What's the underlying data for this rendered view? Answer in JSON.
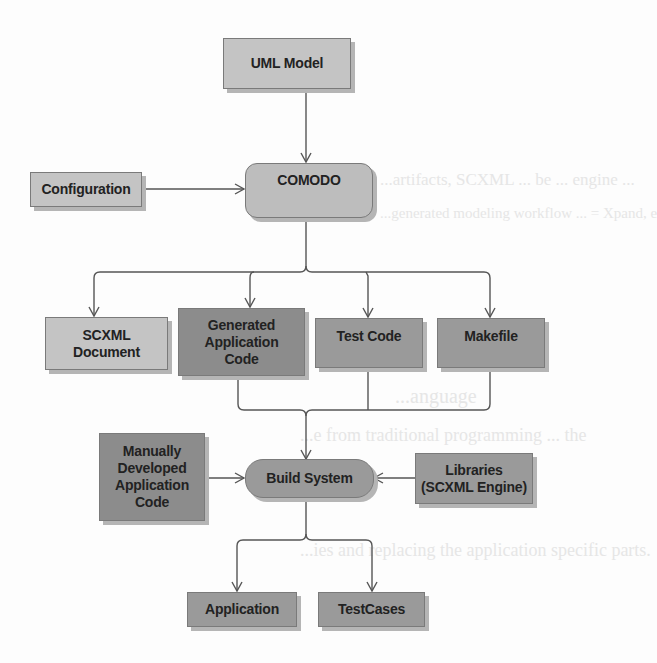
{
  "diagram": {
    "nodes": {
      "uml_model": {
        "label": "UML Model",
        "shape": "rect",
        "fill": "#c4c4c4"
      },
      "configuration": {
        "label": "Configuration",
        "shape": "rect",
        "fill": "#c4c4c4"
      },
      "comodo": {
        "label": "COMODO",
        "shape": "rounded-rect",
        "fill": "#bdbdbd"
      },
      "scxml_document": {
        "label": "SCXML Document",
        "line1": "SCXML",
        "line2": "Document",
        "shape": "rect",
        "fill": "#c4c4c4"
      },
      "generated_application_code": {
        "label": "Generated Application Code",
        "line1": "Generated",
        "line2": "Application",
        "line3": "Code",
        "shape": "rect",
        "fill": "#8c8c8c"
      },
      "test_code": {
        "label": "Test Code",
        "shape": "rect",
        "fill": "#9a9a9a"
      },
      "makefile": {
        "label": "Makefile",
        "shape": "rect",
        "fill": "#9a9a9a"
      },
      "manually_developed_application_code": {
        "label": "Manually Developed Application Code",
        "line1": "Manually",
        "line2": "Developed",
        "line3": "Application",
        "line4": "Code",
        "shape": "rect",
        "fill": "#8c8c8c"
      },
      "build_system": {
        "label": "Build System",
        "shape": "pill",
        "fill": "#9a9a9a"
      },
      "libraries": {
        "label": "Libraries (SCXML Engine)",
        "line1": "Libraries",
        "line2": "(SCXML Engine)",
        "shape": "rect",
        "fill": "#9a9a9a"
      },
      "application": {
        "label": "Application",
        "shape": "rect",
        "fill": "#9a9a9a"
      },
      "testcases": {
        "label": "TestCases",
        "shape": "rect",
        "fill": "#9a9a9a"
      }
    },
    "edges": [
      {
        "from": "UML Model",
        "to": "COMODO"
      },
      {
        "from": "Configuration",
        "to": "COMODO"
      },
      {
        "from": "COMODO",
        "to": "SCXML Document"
      },
      {
        "from": "COMODO",
        "to": "Generated Application Code"
      },
      {
        "from": "COMODO",
        "to": "Test Code"
      },
      {
        "from": "COMODO",
        "to": "Makefile"
      },
      {
        "from": "Generated Application Code",
        "to": "Build System"
      },
      {
        "from": "Test Code",
        "to": "Build System"
      },
      {
        "from": "Makefile",
        "to": "Build System"
      },
      {
        "from": "Manually Developed Application Code",
        "to": "Build System"
      },
      {
        "from": "Libraries (SCXML Engine)",
        "to": "Build System"
      },
      {
        "from": "Build System",
        "to": "Application"
      },
      {
        "from": "Build System",
        "to": "TestCases"
      }
    ],
    "colors": {
      "line": "#555555",
      "shadow": "#b5b5b5",
      "light_box": "#c4c4c4",
      "dark_box": "#8c8c8c",
      "mid_box": "#9a9a9a"
    }
  },
  "background_bleed": {
    "line1": "...artifacts, SCXML ... be ... engine ...",
    "line2": "...generated modeling workflow ... = Xpand, e",
    "line3": "...anguage",
    "line4": "...e from traditional programming ... the",
    "line5": "...ies and replacing the application specific parts."
  }
}
